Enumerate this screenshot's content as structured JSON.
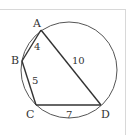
{
  "diagram": {
    "colors": {
      "stroke": "#333333",
      "circle": "#555555",
      "frame": "#d8d8d8"
    },
    "circle": {
      "cx": 69,
      "cy": 70,
      "r": 48
    },
    "vertices": {
      "A": {
        "label": "A",
        "x": 41,
        "y": 30
      },
      "B": {
        "label": "B",
        "x": 22,
        "y": 61
      },
      "C": {
        "label": "C",
        "x": 36,
        "y": 105
      },
      "D": {
        "label": "D",
        "x": 101,
        "y": 105
      }
    },
    "segments": [
      {
        "from": "A",
        "to": "B",
        "length_label": "4"
      },
      {
        "from": "B",
        "to": "C",
        "length_label": "5"
      },
      {
        "from": "C",
        "to": "D",
        "length_label": "7"
      },
      {
        "from": "A",
        "to": "D",
        "length_label": "10"
      }
    ],
    "labels": {
      "A": "A",
      "B": "B",
      "C": "C",
      "D": "D",
      "AB": "4",
      "BC": "5",
      "CD": "7",
      "AD": "10"
    }
  }
}
